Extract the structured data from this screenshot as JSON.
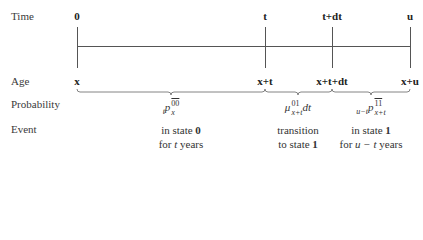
{
  "rows": {
    "time": "Time",
    "age": "Age",
    "probability": "Probability",
    "event": "Event"
  },
  "time_ticks": [
    {
      "label": "0",
      "x": 77
    },
    {
      "label": "t",
      "x": 265
    },
    {
      "label": "t+dt",
      "x": 332
    },
    {
      "label": "u",
      "x": 410
    }
  ],
  "age_ticks": [
    {
      "label": "x",
      "x": 77
    },
    {
      "label": "x+t",
      "x": 265
    },
    {
      "label": "x+t+dt",
      "x": 332
    },
    {
      "label": "x+u",
      "x": 410
    }
  ],
  "probabilities": [
    {
      "prefix": "t",
      "symbol": "p",
      "sup": "00",
      "sub": "x",
      "overline": true,
      "suffix": ""
    },
    {
      "prefix": "",
      "symbol": "μ",
      "sup": "01",
      "sub": "x+t",
      "overline": false,
      "suffix": "dt"
    },
    {
      "prefix": "u−t",
      "symbol": "p",
      "sup": "11",
      "sub": "x+t",
      "overline": true,
      "suffix": ""
    }
  ],
  "events": [
    {
      "line1_text": "in state ",
      "line1_bold": "0",
      "line2_text": "for ",
      "line2_ital": "t",
      "line2_end": " years"
    },
    {
      "line1_text": "transition",
      "line1_bold": "",
      "line2_text": "to state ",
      "line2_ital": "",
      "line2_end": "",
      "line2_bold": "1"
    },
    {
      "line1_text": "in state ",
      "line1_bold": "1",
      "line2_text": "for ",
      "line2_ital": "u − t",
      "line2_end": " years"
    }
  ],
  "colors": {
    "line": "#555555",
    "text": "#2a2a2a"
  }
}
